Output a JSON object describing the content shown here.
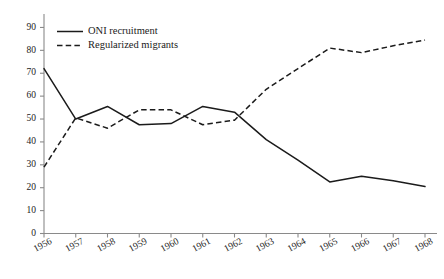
{
  "chart_data": {
    "type": "line",
    "title": "",
    "subtitle": "",
    "xlabel": "",
    "ylabel": "",
    "categories": [
      "1956",
      "1957",
      "1958",
      "1959",
      "1960",
      "1961",
      "1962",
      "1963",
      "1964",
      "1965",
      "1966",
      "1967",
      "1968"
    ],
    "x": [
      1956,
      1957,
      1958,
      1959,
      1960,
      1961,
      1962,
      1963,
      1964,
      1965,
      1966,
      1967,
      1968
    ],
    "xlim": [
      1956,
      1968
    ],
    "ylim": [
      0,
      95
    ],
    "yticks": [
      0,
      10,
      20,
      30,
      40,
      50,
      60,
      70,
      80,
      90
    ],
    "ytick_labels": [
      "0",
      "10",
      "20",
      "30",
      "40",
      "50",
      "60",
      "70",
      "80",
      "90"
    ],
    "grid": false,
    "legend_position": "top-left",
    "series": [
      {
        "name": "ONI recruitment",
        "style": "solid",
        "color": "#1b1b1b",
        "values": [
          72,
          50,
          55.5,
          47.5,
          48,
          55.5,
          53,
          41,
          32,
          22.5,
          25,
          23,
          20.5
        ]
      },
      {
        "name": "Regularized migrants",
        "style": "dashed",
        "color": "#1b1b1b",
        "values": [
          29,
          50.5,
          46,
          54,
          54,
          47.5,
          49.5,
          63,
          72,
          81,
          79,
          82,
          84.5
        ]
      }
    ],
    "annotations": []
  },
  "legend": {
    "items": [
      {
        "label": "ONI recruitment",
        "style": "solid"
      },
      {
        "label": "Regularized migrants",
        "style": "dashed"
      }
    ]
  },
  "axes": {
    "y_label_texts": [
      "90",
      "80",
      "70",
      "60",
      "50",
      "40",
      "30",
      "20",
      "10",
      "0"
    ],
    "x_label_texts": [
      "1956",
      "1957",
      "1958",
      "1959",
      "1960",
      "1961",
      "1962",
      "1963",
      "1964",
      "1965",
      "1966",
      "1967",
      "1968"
    ]
  }
}
